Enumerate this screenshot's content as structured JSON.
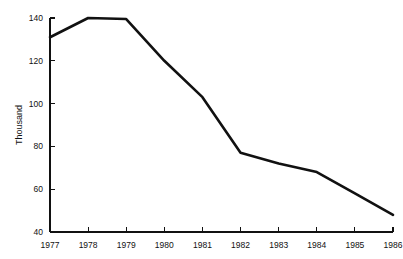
{
  "chart_data": {
    "type": "line",
    "title": "",
    "subtitle": "",
    "xlabel": "",
    "ylabel": "Thousand",
    "x": [
      1977,
      1978,
      1979,
      1980,
      1981,
      1982,
      1983,
      1984,
      1985,
      1986
    ],
    "categories": [
      "1977",
      "1978",
      "1979",
      "1980",
      "1981",
      "1982",
      "1983",
      "1984",
      "1985",
      "1986"
    ],
    "values": [
      131,
      140,
      139.5,
      120,
      103,
      77,
      72,
      68,
      58,
      48
    ],
    "series": [
      {
        "name": "",
        "values": [
          131,
          140,
          139.5,
          120,
          103,
          77,
          72,
          68,
          58,
          48
        ]
      }
    ],
    "xlim": [
      1977,
      1986
    ],
    "ylim": [
      40,
      140
    ],
    "yticks": [
      40,
      60,
      80,
      100,
      120,
      140
    ],
    "ytick_labels": [
      "40",
      "60",
      "80",
      "100",
      "120",
      "140"
    ],
    "xticks": [
      1977,
      1978,
      1979,
      1980,
      1981,
      1982,
      1983,
      1984,
      1985,
      1986
    ],
    "xtick_labels": [
      "1977",
      "1978",
      "1979",
      "1980",
      "1981",
      "1982",
      "1983",
      "1984",
      "1985",
      "1986"
    ],
    "grid": false,
    "legend": false,
    "legend_position": "none",
    "line_color": "#111111",
    "background_color": "#ffffff",
    "annotations": []
  },
  "plot_geometry": {
    "left": 50,
    "right": 393,
    "top": 18,
    "bottom": 232
  }
}
